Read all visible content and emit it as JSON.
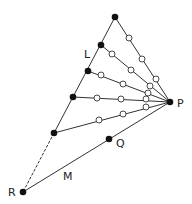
{
  "diagram": {
    "colors": {
      "stroke": "#333333",
      "filled": "#111111",
      "open_fill": "#ffffff",
      "label": "#222222"
    },
    "labels": {
      "L": {
        "text": "L",
        "x": 84,
        "y": 58
      },
      "P": {
        "text": "P",
        "x": 177,
        "y": 107
      },
      "Q": {
        "text": "Q",
        "x": 116,
        "y": 147
      },
      "M": {
        "text": "M",
        "x": 63,
        "y": 180
      },
      "R": {
        "text": "R",
        "x": 8,
        "y": 196
      }
    },
    "points": {
      "P": [
        170,
        102
      ],
      "Q": [
        109,
        139
      ],
      "R": [
        23,
        192
      ],
      "L1": [
        115,
        17
      ],
      "L2": [
        101,
        45
      ],
      "L3": [
        88,
        71
      ],
      "L4": [
        73,
        97
      ],
      "L5": [
        54,
        133
      ]
    },
    "open_circles": [
      [
        129,
        38
      ],
      [
        142,
        59
      ],
      [
        156,
        79
      ],
      [
        112,
        54
      ],
      [
        131,
        70
      ],
      [
        150,
        86
      ],
      [
        101,
        75
      ],
      [
        123,
        84
      ],
      [
        148,
        93
      ],
      [
        97,
        98
      ],
      [
        121,
        99
      ],
      [
        146,
        99
      ],
      [
        99,
        120
      ],
      [
        123,
        114
      ],
      [
        146,
        107
      ]
    ]
  }
}
